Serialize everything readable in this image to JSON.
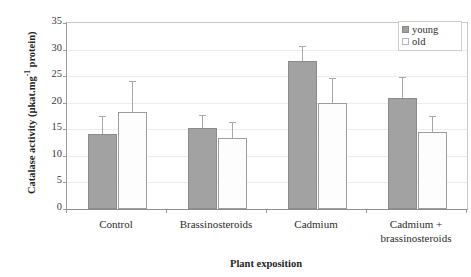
{
  "chart_data": {
    "type": "bar",
    "title": "",
    "subtitle": "",
    "xlabel": "Plant exposition",
    "ylabel_plain": "Catalase activity (µkat.mg-1 protein)",
    "ylabel_parts": {
      "before": "Catalase activity (µkat.mg",
      "superscript": "-1",
      "after": " protein)"
    },
    "categories": [
      "Control",
      "Brassinosteroids",
      "Cadmium",
      "Cadmium + brassinosteroids"
    ],
    "category_lines": [
      [
        "Control"
      ],
      [
        "Brassinosteroids"
      ],
      [
        "Cadmium"
      ],
      [
        "Cadmium +",
        "brassinosteroids"
      ]
    ],
    "series": [
      {
        "name": "young",
        "color": "#a2a2a2",
        "values": [
          14.1,
          15.2,
          27.8,
          20.8
        ],
        "errors": [
          3.4,
          2.5,
          2.9,
          4.0
        ]
      },
      {
        "name": "old",
        "color": "#fdfdfd",
        "values": [
          18.3,
          13.4,
          20.0,
          14.5
        ],
        "errors": [
          5.8,
          3.0,
          4.6,
          3.0
        ]
      }
    ],
    "ylim": [
      0,
      35
    ],
    "yticks": [
      0,
      5,
      10,
      15,
      20,
      25,
      30,
      35
    ],
    "ytick_labels": [
      "0",
      "5",
      "10",
      "15",
      "20",
      "25",
      "30",
      "35"
    ],
    "grid": "horizontal",
    "legend_position": "top-right",
    "error_bar_style": "upper-only"
  },
  "legend": {
    "entries": [
      {
        "label": "young",
        "swatch": "filled-gray-square"
      },
      {
        "label": "old",
        "swatch": "empty-white-square"
      }
    ]
  },
  "colors": {
    "young_fill": "#a2a2a2",
    "young_edge": "#8b8b8b",
    "old_fill": "#fdfdfd",
    "old_edge": "#9d9d9d",
    "axis": "#8e8e8e",
    "grid": "#ececec",
    "error_bar": "#a8a8a8",
    "text": "#2b2b2b"
  }
}
